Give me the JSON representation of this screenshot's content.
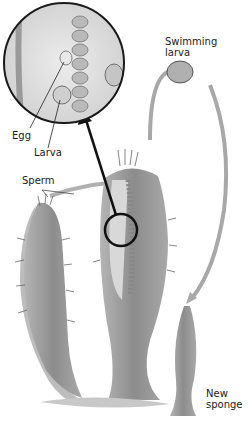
{
  "labels": {
    "egg": "Egg",
    "larva": "Larva",
    "sperm": "Sperm",
    "swimming_larva_1": "Swimming",
    "swimming_larva_2": "larva",
    "new_sponge_1": "New",
    "new_sponge_2": "sponge"
  },
  "colors": {
    "sponge_fill": "#9a9a9a",
    "sponge_dark": "#6e6e6e",
    "arrow_path": "#a8a8a8",
    "pointer_arrow": "#111111",
    "inset_border": "#1a1a1a",
    "background": "#ffffff"
  }
}
